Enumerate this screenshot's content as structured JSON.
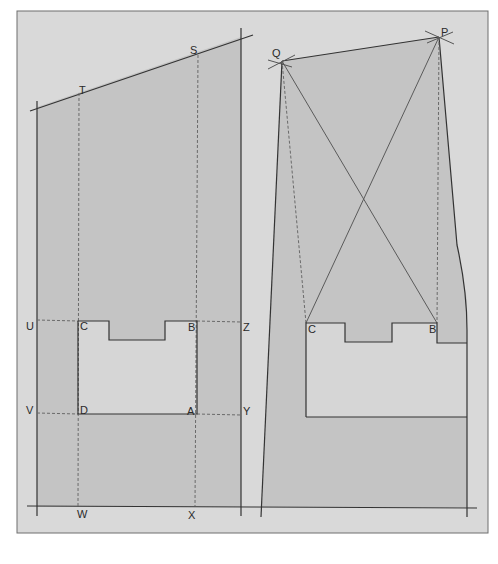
{
  "colors": {
    "page_bg": "#ffffff",
    "frame_bg": "#d9d9d9",
    "shape_fill": "#c4c4c4",
    "inner_fill": "#d6d6d6",
    "line": "#3a3a3a",
    "dashed": "#6a6a6a"
  },
  "left_figure": {
    "labels": {
      "T": "T",
      "S": "S",
      "U": "U",
      "C": "C",
      "B": "B",
      "Z": "Z",
      "V": "V",
      "D": "D",
      "A": "A",
      "Y": "Y",
      "W": "W",
      "X": "X"
    }
  },
  "right_figure": {
    "labels": {
      "Q": "Q",
      "P": "P",
      "C": "C",
      "B": "B"
    }
  }
}
